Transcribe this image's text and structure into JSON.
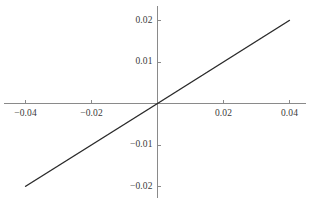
{
  "chart_data": {
    "type": "line",
    "title": "",
    "subtitle": "",
    "xlabel": "",
    "ylabel": "",
    "xlim": [
      -0.0425,
      0.0425
    ],
    "ylim": [
      -0.0225,
      0.0225
    ],
    "grid": false,
    "legend": null,
    "axes_style": "centered-cross",
    "xticks": [
      -0.04,
      -0.02,
      0.02,
      0.04
    ],
    "xtick_labels": [
      "-0.04",
      "-0.02",
      "0.02",
      "0.04"
    ],
    "yticks": [
      -0.02,
      -0.01,
      0.01,
      0.02
    ],
    "ytick_labels": [
      "-0.02",
      "-0.01",
      "0.01",
      "0.02"
    ],
    "series": [
      {
        "name": "curve",
        "color": "#2b2b2b",
        "description": "odd near-linear curve with oscillations whose amplitude and wavelength grow with |x|",
        "x": [
          -0.04,
          -0.0396,
          -0.0392,
          -0.0388,
          -0.0384,
          -0.038,
          -0.0376,
          -0.0372,
          -0.0368,
          -0.0364,
          -0.036,
          -0.0356,
          -0.0352,
          -0.0348,
          -0.0344,
          -0.034,
          -0.0336,
          -0.0332,
          -0.0328,
          -0.0324,
          -0.032,
          -0.0316,
          -0.0312,
          -0.0308,
          -0.0304,
          -0.03,
          -0.0296,
          -0.0292,
          -0.0288,
          -0.0284,
          -0.028,
          -0.0276,
          -0.0272,
          -0.0268,
          -0.0264,
          -0.026,
          -0.0256,
          -0.0252,
          -0.0248,
          -0.0244,
          -0.024,
          -0.0236,
          -0.0232,
          -0.0228,
          -0.0224,
          -0.022,
          -0.0216,
          -0.0212,
          -0.0208,
          -0.0204,
          -0.02,
          -0.0196,
          -0.0192,
          -0.0188,
          -0.0184,
          -0.018,
          -0.0176,
          -0.0172,
          -0.0168,
          -0.0164,
          -0.016,
          -0.0156,
          -0.0152,
          -0.0148,
          -0.0144,
          -0.014,
          -0.0136,
          -0.0132,
          -0.0128,
          -0.0124,
          -0.012,
          -0.0116,
          -0.0112,
          -0.0108,
          -0.0104,
          -0.01,
          -0.009,
          -0.008,
          -0.007,
          -0.006,
          -0.005,
          -0.004,
          -0.003,
          -0.002,
          -0.001,
          0.0,
          0.001,
          0.002,
          0.003,
          0.004,
          0.005,
          0.006,
          0.007,
          0.008,
          0.009,
          0.01,
          0.0104,
          0.0108,
          0.0112,
          0.0116,
          0.012,
          0.0124,
          0.0128,
          0.0132,
          0.0136,
          0.014,
          0.0144,
          0.0148,
          0.0152,
          0.0156,
          0.016,
          0.0164,
          0.0168,
          0.0172,
          0.0176,
          0.018,
          0.0184,
          0.0188,
          0.0192,
          0.0196,
          0.02,
          0.0204,
          0.0208,
          0.0212,
          0.0216,
          0.022,
          0.0224,
          0.0228,
          0.0232,
          0.0236,
          0.024,
          0.0244,
          0.0248,
          0.0252,
          0.0256,
          0.026,
          0.0264,
          0.0268,
          0.0272,
          0.0276,
          0.028,
          0.0284,
          0.0288,
          0.0292,
          0.0296,
          0.03,
          0.0304,
          0.0308,
          0.0312,
          0.0316,
          0.032,
          0.0324,
          0.0328,
          0.0332,
          0.0336,
          0.034,
          0.0344,
          0.0348,
          0.0352,
          0.0356,
          0.036,
          0.0364,
          0.0368,
          0.0372,
          0.0376,
          0.038,
          0.0384,
          0.0388,
          0.0392,
          0.0396,
          0.04
        ],
        "formula": "y = x + 0.55*x*x*sin(0.0016/x)/0.0016*0.85",
        "y_endpoints": {
          "left": -0.0202,
          "right": 0.0198
        }
      }
    ]
  }
}
